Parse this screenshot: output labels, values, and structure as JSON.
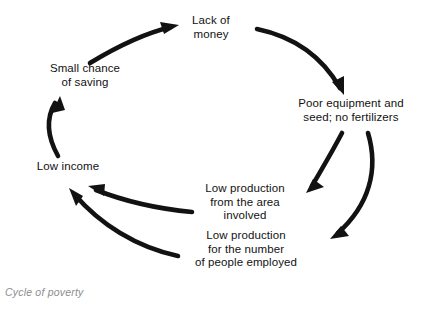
{
  "diagram": {
    "caption": "Cycle of poverty",
    "stroke_color": "#121212",
    "text_color": "#121212",
    "caption_color": "#8d8d8d",
    "background": "#ffffff",
    "nodes": [
      {
        "id": "lack-of-money",
        "label": "Lack of\nmoney"
      },
      {
        "id": "poor-equipment",
        "label": "Poor equipment and\nseed; no fertilizers"
      },
      {
        "id": "low-production-area",
        "label": "Low production\nfrom the area\ninvolved"
      },
      {
        "id": "low-production-number",
        "label": "Low production\nfor the number\nof people employed"
      },
      {
        "id": "low-income",
        "label": "Low income"
      },
      {
        "id": "small-chance",
        "label": "Small chance\nof saving"
      }
    ],
    "edges": [
      {
        "from": "small-chance",
        "to": "lack-of-money"
      },
      {
        "from": "lack-of-money",
        "to": "poor-equipment"
      },
      {
        "from": "poor-equipment",
        "to": "low-production-area"
      },
      {
        "from": "poor-equipment",
        "to": "low-production-number"
      },
      {
        "from": "low-production-area",
        "to": "low-income"
      },
      {
        "from": "low-production-number",
        "to": "low-income"
      },
      {
        "from": "low-income",
        "to": "small-chance"
      }
    ]
  }
}
